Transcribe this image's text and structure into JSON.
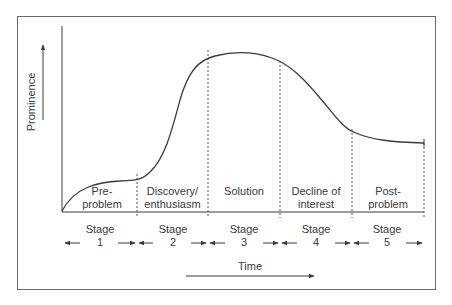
{
  "axes": {
    "y_label": "Prominence",
    "x_label": "Time"
  },
  "regions": [
    {
      "line1": "Pre-",
      "line2": "problem"
    },
    {
      "line1": "Discovery/",
      "line2": "enthusiasm"
    },
    {
      "line1": "Solution",
      "line2": ""
    },
    {
      "line1": "Decline of",
      "line2": "interest"
    },
    {
      "line1": "Post-",
      "line2": "problem"
    }
  ],
  "stages": [
    {
      "word": "Stage",
      "number": "1"
    },
    {
      "word": "Stage",
      "number": "2"
    },
    {
      "word": "Stage",
      "number": "3"
    },
    {
      "word": "Stage",
      "number": "4"
    },
    {
      "word": "Stage",
      "number": "5"
    }
  ],
  "colors": {
    "line": "#3a3a3a",
    "frame": "#6b6b6b",
    "background": "#ffffff"
  }
}
